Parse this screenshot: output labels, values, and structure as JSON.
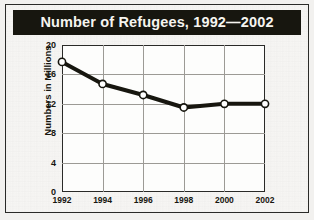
{
  "figure": {
    "title": "Number of Refugees, 1992—2002",
    "title_bar_color": "#17160f",
    "title_text_color": "#f6f4ef",
    "background_color": "#f7f6f4",
    "border_color": "#2a2a28",
    "plot_background_color": "#fdfdfc",
    "gridline_color": "#9c9a95",
    "series_color": "#17160f",
    "marker_fill_color": "#ffffff"
  },
  "chart_data": {
    "type": "line",
    "title": "Number of Refugees, 1992—2002",
    "xlabel": "",
    "ylabel": "Numbers in Millions",
    "categories": [
      "1992",
      "1994",
      "1996",
      "1998",
      "2000",
      "2002"
    ],
    "x": [
      1992,
      1994,
      1996,
      1998,
      2000,
      2002
    ],
    "values": [
      17.7,
      14.7,
      13.2,
      11.5,
      12.0,
      12.0
    ],
    "series": [
      {
        "name": "Refugees",
        "values": [
          17.7,
          14.7,
          13.2,
          11.5,
          12.0,
          12.0
        ]
      }
    ],
    "ylim": [
      0,
      20
    ],
    "yticks": [
      0,
      4,
      8,
      12,
      16,
      20
    ],
    "ytick_labels": [
      "0",
      "4",
      "8",
      "12",
      "16",
      "20"
    ],
    "xlim": [
      1992,
      2002
    ],
    "xticks": [
      1992,
      1994,
      1996,
      1998,
      2000,
      2002
    ],
    "xtick_labels": [
      "1992",
      "1994",
      "1996",
      "1998",
      "2000",
      "2002"
    ],
    "grid": true,
    "legend": false,
    "legend_position": "none",
    "marker": "circle",
    "line_width": 4
  }
}
